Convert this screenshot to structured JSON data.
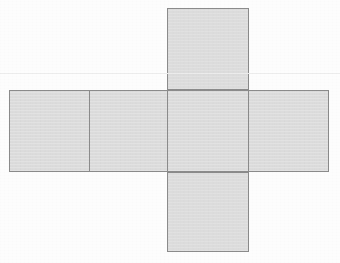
{
  "figure": {
    "canvas": {
      "width": 340,
      "height": 263
    },
    "background_color": "#fdfdfd",
    "fill_color": "#dcdcdc",
    "stroke_color": "#8b8b8b",
    "stroke_width": 1.5,
    "artifact_line": {
      "name": "scan-artifact-line",
      "y": 73,
      "color": "#ededed"
    },
    "faces": [
      {
        "id": "top-face",
        "position": "top",
        "x": 167,
        "y": 8,
        "width": 82,
        "height": 82
      },
      {
        "id": "row-face-1",
        "position": "row-left-outer",
        "x": 9,
        "y": 90,
        "width": 81,
        "height": 82
      },
      {
        "id": "row-face-2",
        "position": "row-left-inner",
        "x": 89,
        "y": 90,
        "width": 79,
        "height": 82
      },
      {
        "id": "row-face-3",
        "position": "row-center",
        "x": 167,
        "y": 90,
        "width": 82,
        "height": 82
      },
      {
        "id": "row-face-4",
        "position": "row-right-outer",
        "x": 248,
        "y": 90,
        "width": 81,
        "height": 82
      },
      {
        "id": "bottom-face",
        "position": "bottom",
        "x": 167,
        "y": 172,
        "width": 82,
        "height": 80
      }
    ]
  }
}
